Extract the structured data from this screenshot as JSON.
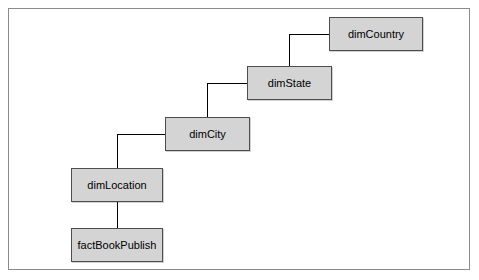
{
  "diagram": {
    "frame": {
      "border_color": "#8a8a8a",
      "background": "#ffffff"
    },
    "node_style": {
      "fill": "#d4d4d4",
      "border": "#4d4d4d",
      "text": "#000000"
    },
    "nodes": [
      {
        "id": "dimCountry",
        "label": "dimCountry",
        "x": 320,
        "y": 8,
        "w": 94,
        "h": 34
      },
      {
        "id": "dimState",
        "label": "dimState",
        "x": 238,
        "y": 57,
        "w": 85,
        "h": 34
      },
      {
        "id": "dimCity",
        "label": "dimCity",
        "x": 156,
        "y": 108,
        "w": 85,
        "h": 34
      },
      {
        "id": "dimLocation",
        "label": "dimLocation",
        "x": 62,
        "y": 159,
        "w": 92,
        "h": 34
      },
      {
        "id": "factBookPublish",
        "label": "factBookPublish",
        "x": 62,
        "y": 219,
        "w": 92,
        "h": 34
      }
    ],
    "edges": [
      {
        "from": "dimState",
        "to": "dimCountry"
      },
      {
        "from": "dimCity",
        "to": "dimState"
      },
      {
        "from": "dimLocation",
        "to": "dimCity"
      },
      {
        "from": "factBookPublish",
        "to": "dimLocation"
      }
    ]
  }
}
